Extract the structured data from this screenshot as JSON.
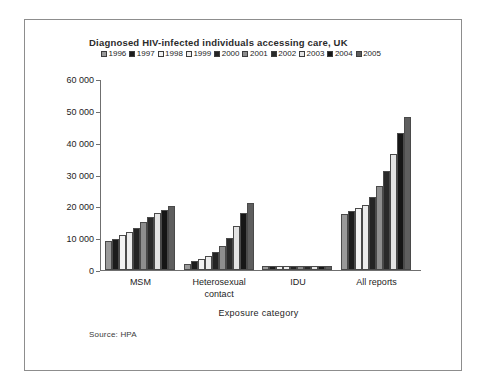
{
  "figure": {
    "title": "Diagnosed HIV-infected individuals accessing care, UK",
    "source_note": "Source: HPA"
  },
  "chart_data": {
    "type": "bar",
    "title": "Diagnosed HIV-infected individuals accessing care, UK",
    "xlabel": "Exposure category",
    "ylabel": "",
    "ylim": [
      0,
      60000
    ],
    "yticks": [
      0,
      10000,
      20000,
      30000,
      40000,
      50000,
      60000
    ],
    "ytick_labels": [
      "0",
      "10 000",
      "20 000",
      "30 000",
      "40 000",
      "50 000",
      "60 000"
    ],
    "grid": false,
    "legend_position": "top-left",
    "categories": [
      "MSM",
      "Heterosexual contact",
      "IDU",
      "All reports"
    ],
    "series": [
      {
        "name": "1996",
        "color": "#9a9a9a",
        "values": [
          9000,
          2000,
          1300,
          17500
        ]
      },
      {
        "name": "1997",
        "color": "#1c1c1c",
        "values": [
          9800,
          2700,
          1300,
          18500
        ]
      },
      {
        "name": "1998",
        "color": "#f2f2f2",
        "values": [
          11000,
          3500,
          1300,
          19500
        ]
      },
      {
        "name": "1999",
        "color": "#ededed",
        "values": [
          11800,
          4300,
          1300,
          20500
        ]
      },
      {
        "name": "2000",
        "color": "#242424",
        "values": [
          13200,
          5600,
          1300,
          23000
        ]
      },
      {
        "name": "2001",
        "color": "#8e8e8e",
        "values": [
          15000,
          7600,
          1300,
          26500
        ]
      },
      {
        "name": "2002",
        "color": "#2a2a2a",
        "values": [
          16500,
          10200,
          1400,
          31000
        ]
      },
      {
        "name": "2003",
        "color": "#e4e4e4",
        "values": [
          17800,
          13800,
          1400,
          36500
        ]
      },
      {
        "name": "2004",
        "color": "#161616",
        "values": [
          19000,
          17800,
          1400,
          43000
        ]
      },
      {
        "name": "2005",
        "color": "#5e5e5e",
        "values": [
          20000,
          21200,
          1400,
          48000
        ]
      }
    ]
  }
}
